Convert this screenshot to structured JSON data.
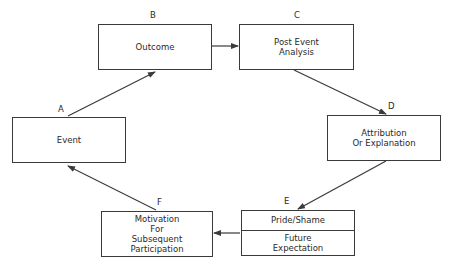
{
  "diagram": {
    "type": "cycle-flowchart",
    "colors": {
      "stroke": "#3a3a3a",
      "text": "#2a2a2a",
      "background": "#ffffff"
    },
    "nodes": {
      "A": {
        "letter": "A",
        "lines": [
          "Event"
        ]
      },
      "B": {
        "letter": "B",
        "lines": [
          "Outcome"
        ]
      },
      "C": {
        "letter": "C",
        "lines": [
          "Post Event",
          "Analysis"
        ]
      },
      "D": {
        "letter": "D",
        "lines": [
          "Attribution",
          "Or Explanation"
        ]
      },
      "E": {
        "letter": "E",
        "top": "Pride/Shame",
        "bottom": [
          "Future",
          "Expectation"
        ]
      },
      "F": {
        "letter": "F",
        "lines": [
          "Motivation",
          "For",
          "Subsequent",
          "Participation"
        ]
      }
    },
    "edges": [
      {
        "from": "A",
        "to": "B"
      },
      {
        "from": "B",
        "to": "C"
      },
      {
        "from": "C",
        "to": "D"
      },
      {
        "from": "D",
        "to": "E"
      },
      {
        "from": "E",
        "to": "F"
      },
      {
        "from": "F",
        "to": "A"
      }
    ]
  }
}
